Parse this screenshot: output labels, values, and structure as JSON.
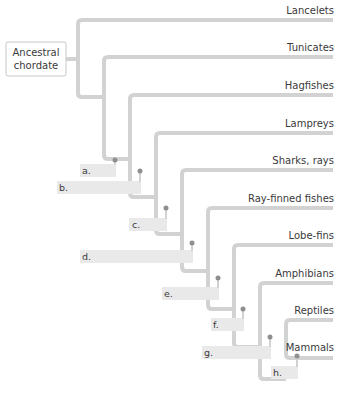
{
  "diagram": {
    "type": "cladogram",
    "root": {
      "label_line1": "Ancestral",
      "label_line2": "chordate"
    },
    "taxa": [
      {
        "name": "Lancelets"
      },
      {
        "name": "Tunicates"
      },
      {
        "name": "Hagfishes"
      },
      {
        "name": "Lampreys"
      },
      {
        "name": "Sharks, rays"
      },
      {
        "name": "Ray-finned fishes"
      },
      {
        "name": "Lobe-fins"
      },
      {
        "name": "Amphibians"
      },
      {
        "name": "Reptiles"
      },
      {
        "name": "Mammals"
      }
    ],
    "nodes": [
      {
        "letter": "a."
      },
      {
        "letter": "b."
      },
      {
        "letter": "c."
      },
      {
        "letter": "d."
      },
      {
        "letter": "e."
      },
      {
        "letter": "f."
      },
      {
        "letter": "g."
      },
      {
        "letter": "h."
      }
    ],
    "colors": {
      "branch": "#d2d2d2",
      "node_dot": "#8f8f8f",
      "label_box": "#e9e9e9",
      "text": "#3a3a3a"
    }
  }
}
